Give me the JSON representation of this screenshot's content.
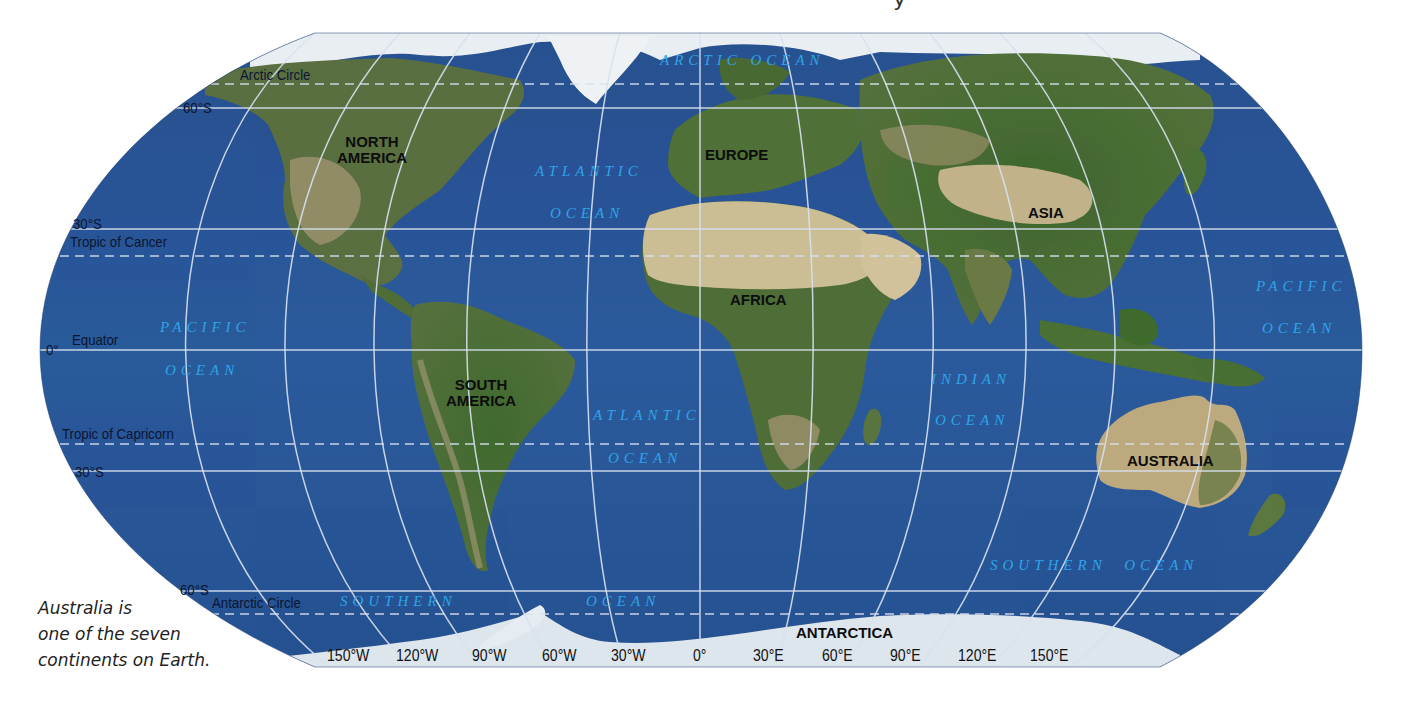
{
  "map": {
    "projection_outline": "rounded pseudo-cylindrical world map",
    "colors": {
      "ocean": "#2a5597",
      "ocean_dark": "#1f4785",
      "land_green": "#4a6b35",
      "land_desert": "#c9b88f",
      "ice": "#dfe8ef",
      "graticule": "#d8e2f0",
      "ocean_label": "#2fa4e8",
      "continent_label": "#0d0d0d",
      "grid_label": "#0b1530"
    },
    "latitude_labels": [
      {
        "id": "lat-60n",
        "text": "60°S",
        "x": 183,
        "y": 100
      },
      {
        "id": "lat-30n",
        "text": "30°S",
        "x": 73,
        "y": 216
      },
      {
        "id": "lat-0",
        "text": "0°",
        "x": 46,
        "y": 342
      },
      {
        "id": "lat-30s",
        "text": "30°S",
        "x": 75,
        "y": 464
      },
      {
        "id": "lat-60s",
        "text": "60°S",
        "x": 180,
        "y": 582
      }
    ],
    "special_lines": [
      {
        "id": "arctic-circle",
        "text": "Arctic Circle",
        "x": 240,
        "y": 67
      },
      {
        "id": "tropic-cancer",
        "text": "Tropic of Cancer",
        "x": 70,
        "y": 234
      },
      {
        "id": "equator",
        "text": "Equator",
        "x": 72,
        "y": 332
      },
      {
        "id": "tropic-capricorn",
        "text": "Tropic of Capricorn",
        "x": 62,
        "y": 426
      },
      {
        "id": "antarctic-circle",
        "text": "Antarctic Circle",
        "x": 212,
        "y": 595
      }
    ],
    "longitude_labels": [
      {
        "text": "150°W",
        "x": 327
      },
      {
        "text": "120°W",
        "x": 396
      },
      {
        "text": "90°W",
        "x": 472
      },
      {
        "text": "60°W",
        "x": 542
      },
      {
        "text": "30°W",
        "x": 611
      },
      {
        "text": "0°",
        "x": 693
      },
      {
        "text": "30°E",
        "x": 753
      },
      {
        "text": "60°E",
        "x": 822
      },
      {
        "text": "90°E",
        "x": 890
      },
      {
        "text": "120°E",
        "x": 958
      },
      {
        "text": "150°E",
        "x": 1030
      }
    ],
    "continents": [
      {
        "id": "north-america",
        "lines": [
          "NORTH",
          "AMERICA"
        ],
        "x": 337,
        "y": 134
      },
      {
        "id": "europe",
        "lines": [
          "EUROPE"
        ],
        "x": 705,
        "y": 147
      },
      {
        "id": "asia",
        "lines": [
          "ASIA"
        ],
        "x": 1028,
        "y": 205
      },
      {
        "id": "africa",
        "lines": [
          "AFRICA"
        ],
        "x": 730,
        "y": 292
      },
      {
        "id": "south-america",
        "lines": [
          "SOUTH",
          "AMERICA"
        ],
        "x": 446,
        "y": 377
      },
      {
        "id": "australia",
        "lines": [
          "AUSTRALIA"
        ],
        "x": 1127,
        "y": 453
      },
      {
        "id": "antarctica",
        "lines": [
          "ANTARCTICA"
        ],
        "x": 796,
        "y": 625
      }
    ],
    "oceans": [
      {
        "id": "arctic-ocean",
        "text": "ARCTIC OCEAN",
        "x": 660,
        "y": 53
      },
      {
        "id": "atlantic-ocean-north-1",
        "text": "ATLANTIC",
        "x": 535,
        "y": 164
      },
      {
        "id": "atlantic-ocean-north-2",
        "text": "OCEAN",
        "x": 550,
        "y": 206
      },
      {
        "id": "pacific-ocean-west-1",
        "text": "PACIFIC",
        "x": 160,
        "y": 320
      },
      {
        "id": "pacific-ocean-west-2",
        "text": "OCEAN",
        "x": 165,
        "y": 363
      },
      {
        "id": "atlantic-ocean-south-1",
        "text": "ATLANTIC",
        "x": 593,
        "y": 408
      },
      {
        "id": "atlantic-ocean-south-2",
        "text": "OCEAN",
        "x": 608,
        "y": 451
      },
      {
        "id": "indian-ocean-1",
        "text": "INDIAN",
        "x": 931,
        "y": 372
      },
      {
        "id": "indian-ocean-2",
        "text": "OCEAN",
        "x": 935,
        "y": 413
      },
      {
        "id": "pacific-ocean-east-1",
        "text": "PACIFIC",
        "x": 1256,
        "y": 279
      },
      {
        "id": "pacific-ocean-east-2",
        "text": "OCEAN",
        "x": 1262,
        "y": 321
      },
      {
        "id": "southern-ocean-east",
        "text": "SOUTHERN  OCEAN",
        "x": 990,
        "y": 558
      },
      {
        "id": "southern-ocean-west-1",
        "text": "SOUTHERN",
        "x": 340,
        "y": 594
      },
      {
        "id": "southern-ocean-west-2",
        "text": "OCEAN",
        "x": 586,
        "y": 594
      }
    ]
  },
  "caption": {
    "lines": [
      "Australia is",
      "one of the seven",
      "continents on Earth."
    ]
  },
  "top_fragment": "y"
}
